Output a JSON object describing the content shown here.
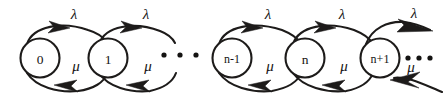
{
  "figure": {
    "type": "state-transition-diagram",
    "background_color": "#ffffff",
    "ink_color": "#1d1b1a",
    "width": 445,
    "height": 100
  },
  "nodes": [
    {
      "id": "s0",
      "label": "0",
      "cx": 40,
      "cy": 58,
      "r": 19.5
    },
    {
      "id": "s1",
      "label": "1",
      "cx": 108,
      "cy": 58,
      "r": 19.5
    },
    {
      "id": "snm1",
      "label": "n-1",
      "cx": 232,
      "cy": 58,
      "r": 19.5
    },
    {
      "id": "sn",
      "label": "n",
      "cx": 305,
      "cy": 58,
      "r": 19.5
    },
    {
      "id": "snp1",
      "label": "n+1",
      "cx": 380,
      "cy": 58,
      "r": 19.5
    }
  ],
  "transitions": [
    {
      "id": "t0",
      "from": "0",
      "to": "1",
      "rate": "λ",
      "direction": "forward",
      "label_x": 74,
      "label_y": 14
    },
    {
      "id": "t1",
      "from": "1",
      "to": "0",
      "rate": "μ",
      "direction": "backward",
      "label_x": 76,
      "label_y": 66
    },
    {
      "id": "t2",
      "from": "1",
      "to": "2",
      "rate": "λ",
      "direction": "forward",
      "label_x": 146,
      "label_y": 14
    },
    {
      "id": "t3",
      "from": "2",
      "to": "1",
      "rate": "μ",
      "direction": "backward",
      "label_x": 148,
      "label_y": 66
    },
    {
      "id": "t4",
      "from": "n-1",
      "to": "n",
      "rate": "λ",
      "direction": "forward",
      "label_x": 268,
      "label_y": 14
    },
    {
      "id": "t5",
      "from": "n",
      "to": "n-1",
      "rate": "μ",
      "direction": "backward",
      "label_x": 270,
      "label_y": 66
    },
    {
      "id": "t6",
      "from": "n",
      "to": "n+1",
      "rate": "λ",
      "direction": "forward",
      "label_x": 342,
      "label_y": 14
    },
    {
      "id": "t7",
      "from": "n+1",
      "to": "n",
      "rate": "μ",
      "direction": "backward",
      "label_x": 344,
      "label_y": 66
    },
    {
      "id": "t8",
      "from": "n+1",
      "to": "n+2",
      "rate": "λ",
      "direction": "forward",
      "label_x": 414,
      "label_y": 13
    },
    {
      "id": "t9",
      "from": "n+2",
      "to": "n+1",
      "rate": "μ",
      "direction": "backward",
      "label_x": 411,
      "label_y": 67
    }
  ],
  "ellipses": [
    {
      "id": "mid-ellipsis",
      "glyph": "…",
      "cx": 180,
      "cy": 55,
      "dot_xs": [
        164,
        180,
        196
      ]
    },
    {
      "id": "right-ellipsis",
      "glyph": "…",
      "cx": 418,
      "cy": 58,
      "dot_xs": [
        408,
        419,
        430
      ]
    }
  ],
  "labels": {
    "lambda": "λ",
    "mu": "μ",
    "state_0": "0",
    "state_1": "1",
    "state_n_minus_1": "n-1",
    "state_n": "n",
    "state_n_plus_1": "n+1"
  }
}
